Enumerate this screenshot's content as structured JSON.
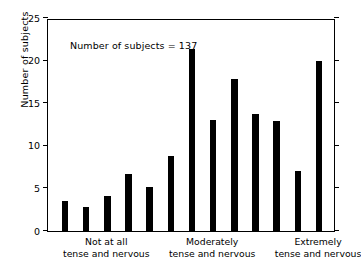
{
  "chart_data": {
    "type": "bar",
    "title": "",
    "subtitle": "",
    "xlabel": "",
    "ylabel": "Number of subjects",
    "ylim": [
      0,
      25
    ],
    "yticks": [
      0,
      5,
      10,
      15,
      20,
      25
    ],
    "ytick_labels": [
      "0",
      "5",
      "10",
      "15",
      "20",
      "25"
    ],
    "grid": false,
    "legend": null,
    "annotation": "Number of subjects = 137",
    "bar_color": "#000000",
    "categories": [
      "1",
      "2",
      "3",
      "4",
      "5",
      "6",
      "7",
      "8",
      "9",
      "10",
      "11",
      "12",
      "13"
    ],
    "values": [
      3.5,
      2.8,
      4.1,
      6.7,
      5.2,
      8.8,
      21.4,
      13.0,
      17.9,
      13.7,
      12.9,
      7.0,
      19.9
    ],
    "x_group_labels": [
      {
        "line1": "Not at all",
        "line2": "tense and nervous",
        "at_bar": 2
      },
      {
        "line1": "Moderately",
        "line2": "tense and nervous",
        "at_bar": 7
      },
      {
        "line1": "Extremely",
        "line2": "tense and nervous",
        "at_bar": 12
      }
    ]
  }
}
